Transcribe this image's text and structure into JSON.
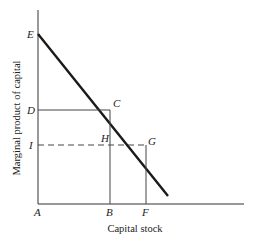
{
  "diagram": {
    "xlabel": "Capital stock",
    "ylabel": "Marginal product of capital",
    "points": {
      "A": "A",
      "B": "B",
      "C": "C",
      "D": "D",
      "E": "E",
      "F": "F",
      "G": "G",
      "H": "H",
      "I": "I"
    },
    "colors": {
      "line": "#1a1a1a",
      "axis": "#333333",
      "guide": "#444444"
    }
  }
}
